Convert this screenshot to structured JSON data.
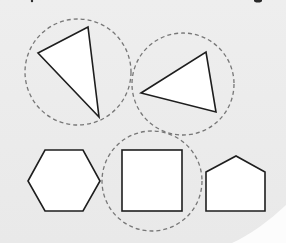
{
  "figure": {
    "background": "#ebebeb",
    "shape_fill": "#ffffff",
    "shape_stroke": "#1e1e1e",
    "ring_stroke": "#777777",
    "shapes": [
      {
        "id": "triangle-1",
        "type": "triangle",
        "circled": true,
        "points": "38,53 88,27 99,117"
      },
      {
        "id": "triangle-2",
        "type": "triangle",
        "circled": true,
        "points": "141,93 206,52 216,112"
      },
      {
        "id": "hexagon",
        "type": "hexagon",
        "circled": false,
        "points": "28,181 45,150 83,150 100,181 83,211 45,211"
      },
      {
        "id": "square",
        "type": "square",
        "circled": true,
        "x": 122,
        "y": 150,
        "width": 60,
        "height": 61
      },
      {
        "id": "pentagon",
        "type": "pentagon",
        "circled": false,
        "points": "206,172 236,156 265,172 265,211 206,211"
      }
    ],
    "rings": [
      {
        "id": "ring-triangle-1",
        "cx": 78,
        "cy": 72,
        "r": 53
      },
      {
        "id": "ring-triangle-2",
        "cx": 183,
        "cy": 84,
        "r": 51
      },
      {
        "id": "ring-square",
        "cx": 152,
        "cy": 181,
        "r": 50
      }
    ]
  }
}
